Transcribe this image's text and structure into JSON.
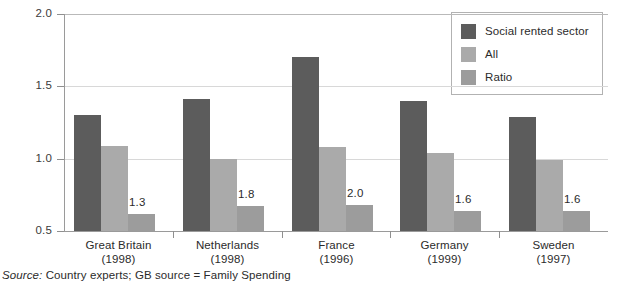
{
  "chart_data": {
    "type": "bar",
    "title": "",
    "xlabel": "",
    "ylabel": "",
    "ylim": [
      0.5,
      2.0
    ],
    "yticks": [
      "0.5",
      "1.0",
      "1.5",
      "2.0"
    ],
    "ytick_values": [
      0.5,
      1.0,
      1.5,
      2.0
    ],
    "grid": true,
    "legend_position": "top-right",
    "categories": [
      "Great Britain\n(1998)",
      "Netherlands\n(1998)",
      "France\n(1996)",
      "Germany\n(1999)",
      "Sweden\n(1997)"
    ],
    "category_names": [
      "Great Britain",
      "Netherlands",
      "France",
      "Germany",
      "Sweden"
    ],
    "category_years": [
      "(1998)",
      "(1998)",
      "(1996)",
      "(1999)",
      "(1997)"
    ],
    "series": [
      {
        "name": "Social rented sector",
        "color": "#5c5c5c",
        "values": [
          1.3,
          1.41,
          1.7,
          1.4,
          1.29
        ]
      },
      {
        "name": "All",
        "color": "#aaaaaa",
        "values": [
          1.09,
          1.0,
          1.08,
          1.04,
          0.99
        ]
      },
      {
        "name": "Ratio",
        "color": "#9c9c9c",
        "values": [
          0.62,
          0.67,
          0.68,
          0.64,
          0.64
        ]
      }
    ],
    "data_labels": [
      "1.3",
      "1.8",
      "2.0",
      "1.6",
      "1.6"
    ],
    "data_labels_series": "Ratio",
    "annotations": [
      "1.3",
      "1.8",
      "2.0",
      "1.6",
      "1.6"
    ]
  },
  "legend": {
    "items": [
      {
        "label": "Social rented sector",
        "color": "#5c5c5c"
      },
      {
        "label": "All",
        "color": "#aaaaaa"
      },
      {
        "label": "Ratio",
        "color": "#9c9c9c"
      }
    ]
  },
  "source": {
    "lead": "Source:",
    "text": " Country experts; GB source = Family Spending"
  }
}
